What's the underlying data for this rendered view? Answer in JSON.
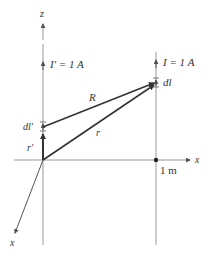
{
  "diagram": {
    "axes": {
      "z_label": "z",
      "x_label_horizontal": "x",
      "x_label_diagonal": "x"
    },
    "left_wire": {
      "current_label": "I′ = 1 A",
      "element_label": "dl′",
      "position_vector_label": "r′"
    },
    "right_wire": {
      "current_label": "I = 1 A",
      "element_label": "dl",
      "distance_label": "1 m"
    },
    "vectors": {
      "separation_label": "R",
      "position_label": "r"
    },
    "colors": {
      "axis": "#888888",
      "vector": "#333333"
    }
  }
}
